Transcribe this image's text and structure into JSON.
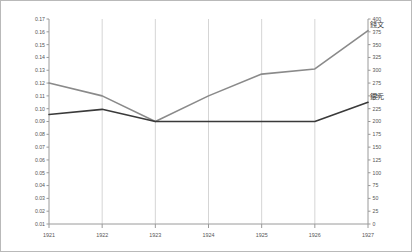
{
  "chart_data": {
    "type": "line",
    "title": "",
    "subtitle": "",
    "xlabel": "",
    "ylabel": "",
    "y2label": "",
    "grid": "vertical-category-gridlines",
    "legend_position": "inline-right-of-line-end",
    "categories": [
      "1921",
      "1922",
      "1923",
      "1924",
      "1925",
      "1926",
      "1927"
    ],
    "ylim": [
      0.01,
      0.17
    ],
    "yticks": [
      "0.17",
      "0.16",
      "0.15",
      "0.14",
      "0.13",
      "0.12",
      "0.11",
      "0.10",
      "0.09",
      "0.08",
      "0.07",
      "0.06",
      "0.05",
      "0.04",
      "0.03",
      "0.02",
      "0.01"
    ],
    "ytick_values": [
      0.17,
      0.16,
      0.15,
      0.14,
      0.13,
      0.12,
      0.11,
      0.1,
      0.09,
      0.08,
      0.07,
      0.06,
      0.05,
      0.04,
      0.03,
      0.02,
      0.01
    ],
    "y2lim": [
      0,
      400
    ],
    "y2ticks": [
      "400",
      "375",
      "350",
      "325",
      "300",
      "275",
      "250",
      "225",
      "200",
      "175",
      "150",
      "125",
      "100",
      "75",
      "50",
      "25",
      "0"
    ],
    "y2tick_values": [
      400,
      375,
      350,
      325,
      300,
      275,
      250,
      225,
      200,
      175,
      150,
      125,
      100,
      75,
      50,
      25,
      0
    ],
    "series": [
      {
        "name": "錢文",
        "color": "#8a8a8a",
        "axis": "left",
        "values": [
          0.12,
          0.11,
          0.09,
          0.11,
          0.127,
          0.131,
          0.161
        ]
      },
      {
        "name": "銀元",
        "color": "#3a3a3a",
        "axis": "left",
        "values": [
          0.0955,
          0.0995,
          0.09,
          0.09,
          0.09,
          0.09,
          0.105
        ]
      }
    ],
    "annotations": [
      {
        "text": "錢文",
        "series": "錢文",
        "at_category": "1927"
      },
      {
        "text": "銀元",
        "series": "銀元",
        "at_category": "1927"
      }
    ]
  },
  "colors": {
    "frame": "#b9b9b9",
    "axis": "#9a9a9a",
    "grid": "#d5d5d5",
    "text": "#555555",
    "series_copper": "#8a8a8a",
    "series_silver": "#3a3a3a",
    "background": "#ffffff"
  }
}
